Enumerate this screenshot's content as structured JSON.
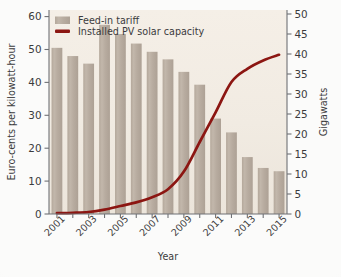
{
  "chart_data": {
    "type": "bar",
    "title": "",
    "subtitle": "",
    "xlabel": "Year",
    "ylabel": "Euro-cents per kilowatt-hour",
    "y2label": "Gigawatts",
    "categories": [
      2001,
      2002,
      2003,
      2004,
      2005,
      2006,
      2007,
      2008,
      2009,
      2010,
      2011,
      2012,
      2013,
      2014,
      2015
    ],
    "xtick_labels": [
      "2001",
      "2003",
      "2005",
      "2007",
      "2009",
      "2011",
      "2013",
      "2015"
    ],
    "xtick_values": [
      2001,
      2003,
      2005,
      2007,
      2009,
      2011,
      2013,
      2015
    ],
    "ylim": [
      0,
      62
    ],
    "y2lim": [
      0,
      51
    ],
    "yticks": [
      0,
      10,
      20,
      30,
      40,
      50,
      60
    ],
    "y2ticks": [
      0,
      5,
      10,
      15,
      20,
      25,
      30,
      35,
      40,
      45,
      50
    ],
    "grid": false,
    "legend_position": "top-left",
    "series": [
      {
        "name": "Feed-in tariff",
        "type": "bar",
        "axis": "left",
        "unit": "Euro-cents per kilowatt-hour",
        "color": "#b9ada0",
        "values": [
          50.5,
          48.0,
          45.7,
          57.5,
          54.7,
          51.8,
          49.3,
          47.0,
          43.2,
          39.3,
          29.0,
          24.8,
          17.3,
          14.0,
          13.0
        ]
      },
      {
        "name": "Installed PV solar capacity",
        "type": "line",
        "axis": "right",
        "unit": "Gigawatts",
        "color": "#8c1612",
        "values": [
          0.2,
          0.3,
          0.5,
          1.1,
          2.0,
          2.9,
          4.2,
          6.2,
          10.6,
          18.0,
          25.4,
          33.0,
          36.3,
          38.4,
          39.8
        ]
      }
    ]
  },
  "legend": {
    "items": [
      {
        "label": "Feed-in tariff",
        "marker": "swatch",
        "color": "#b9ada0"
      },
      {
        "label": "Installed PV solar capacity",
        "marker": "line",
        "color": "#8c1612"
      }
    ]
  },
  "colors": {
    "bar": "#b9ada0",
    "line": "#8c1612",
    "plot_background": "#f2ece3",
    "page_background": "#fbfbfa",
    "axis": "#6f7175",
    "text": "#3b3b3d"
  }
}
